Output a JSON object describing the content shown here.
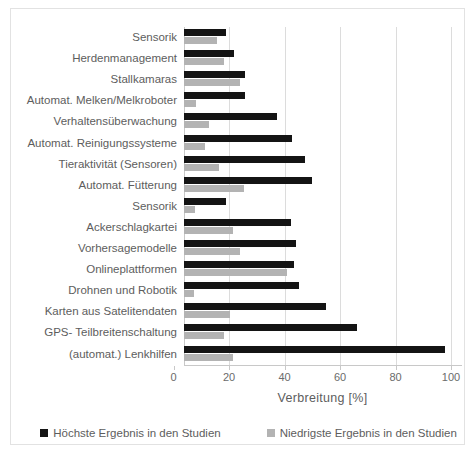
{
  "chart_data": {
    "type": "bar",
    "orientation": "horizontal",
    "title": "",
    "xlabel": "Verbreitung  [%]",
    "ylabel": "",
    "xlim": [
      0,
      100
    ],
    "xticks": [
      0,
      20,
      40,
      60,
      80,
      100
    ],
    "grid": true,
    "legend_position": "bottom",
    "categories": [
      "Sensorik",
      "Herdenmanagement",
      "Stallkamaras",
      "Automat. Melken/Melkroboter",
      "Verhaltensüberwachung",
      "Automat. Reinigungssysteme",
      "Tieraktivität (Sensoren)",
      "Automat. Fütterung",
      "Sensorik",
      "Ackerschlagkartei",
      "Vorhersagemodelle",
      "Onlineplattformen",
      "Drohnen und Robotik",
      "Karten aus Satelitendaten",
      "GPS- Teilbreitenschaltung",
      "(automat.) Lenkhilfen"
    ],
    "series": [
      {
        "name": "Höchste Ergebnis in den Studien",
        "color": "#141414",
        "values": [
          15,
          18,
          22,
          22,
          33.5,
          39,
          43.5,
          46,
          15,
          38.5,
          40.5,
          39.5,
          41.5,
          51,
          62.5,
          94
        ]
      },
      {
        "name": "Niedrigste Ergebnis in den Studien",
        "color": "#b3b3b3",
        "values": [
          12,
          14.5,
          20,
          4.5,
          9,
          7.5,
          12.5,
          21.5,
          4,
          17.5,
          20,
          37,
          3.5,
          16.5,
          14.5,
          17.5
        ]
      }
    ]
  },
  "legend": [
    {
      "label": "Höchste Ergebnis in den Studien",
      "color": "#141414"
    },
    {
      "label": "Niedrigste Ergebnis in den Studien",
      "color": "#b3b3b3"
    }
  ],
  "axis": {
    "x_title": "Verbreitung  [%]",
    "x_tick_labels": [
      "0",
      "20",
      "40",
      "60",
      "80",
      "100"
    ]
  }
}
